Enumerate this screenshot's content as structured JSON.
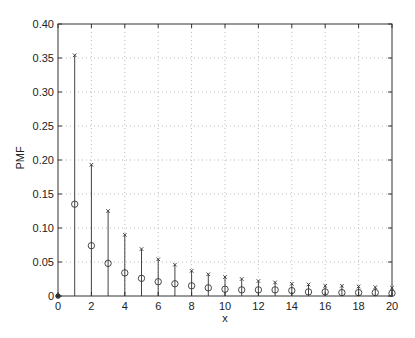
{
  "chart_data": {
    "type": "stem",
    "title": "",
    "xlabel": "x",
    "ylabel": "PMF",
    "xlim": [
      0,
      20
    ],
    "ylim": [
      0,
      0.4
    ],
    "grid": true,
    "legend": null,
    "x_ticks": [
      0,
      2,
      4,
      6,
      8,
      10,
      12,
      14,
      16,
      18,
      20
    ],
    "x_tick_labels": [
      "0",
      "2",
      "4",
      "6",
      "8",
      "10",
      "12",
      "14",
      "16",
      "18",
      "20"
    ],
    "y_ticks": [
      0,
      0.05,
      0.1,
      0.15,
      0.2,
      0.25,
      0.3,
      0.35,
      0.4
    ],
    "y_tick_labels": [
      "0",
      "0.05",
      "0.10",
      "0.15",
      "0.20",
      "0.25",
      "0.30",
      "0.35",
      "0.40"
    ],
    "x": [
      0,
      1,
      2,
      3,
      4,
      5,
      6,
      7,
      8,
      9,
      10,
      11,
      12,
      13,
      14,
      15,
      16,
      17,
      18,
      19,
      20
    ],
    "series": [
      {
        "name": "x-marker series",
        "marker": "x",
        "values": [
          0,
          0.354,
          0.193,
          0.125,
          0.09,
          0.069,
          0.054,
          0.046,
          0.037,
          0.032,
          0.028,
          0.025,
          0.022,
          0.02,
          0.018,
          0.017,
          0.015,
          0.015,
          0.014,
          0.013,
          0.012
        ]
      },
      {
        "name": "circle-marker series",
        "marker": "o",
        "values": [
          0,
          0.135,
          0.074,
          0.048,
          0.034,
          0.026,
          0.021,
          0.018,
          0.015,
          0.012,
          0.01,
          0.009,
          0.009,
          0.009,
          0.008,
          0.006,
          0.006,
          0.005,
          0.005,
          0.005,
          0.004
        ]
      }
    ]
  },
  "colors": {
    "axes": "#333333",
    "stem": "#444444",
    "grid": "#bdbdbd",
    "marker": "#333333",
    "background": "#ffffff"
  }
}
